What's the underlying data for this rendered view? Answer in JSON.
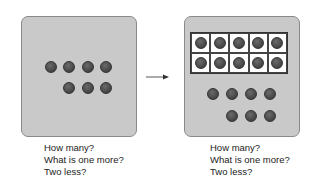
{
  "left_panel": {
    "dots": 7,
    "caption": [
      "How many?",
      "What is one more?",
      "Two less?"
    ]
  },
  "right_panel": {
    "ten_frame": {
      "rows": 2,
      "cols": 5,
      "filled": 10
    },
    "extra_dots": 7,
    "caption": [
      "How many?",
      "What is one more?",
      "Two less?"
    ]
  },
  "arrow": "right-arrow",
  "colors": {
    "panel_bg": "#c9c9c9",
    "dot": "#4a4a4a",
    "frame_bg": "#ffffff"
  }
}
